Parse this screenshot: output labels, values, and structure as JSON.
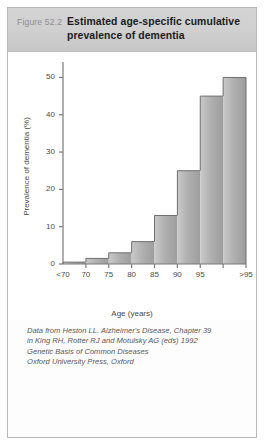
{
  "figure": {
    "number_label": "Figure 52.2",
    "title_line1": "Estimated age-specific cumulative",
    "title_line2": "prevalence of dementia"
  },
  "caption": {
    "line1": "Data from Heston LL. Alzheimer's Disease, Chapter 39",
    "line2": "in King RH, Rotter RJ and Motulsky AG (eds) 1992",
    "line3": "Genetic Basis of Common Diseases",
    "line4": "Oxford University Press, Oxford"
  },
  "colors": {
    "header_band": "#cfcfcf",
    "bar_fill": "#a8a8a8",
    "bar_edge": "#6f6f6f",
    "axis": "#7a7a7a",
    "text": "#4b4b4b"
  },
  "chart_data": {
    "type": "bar",
    "title": "Estimated age-specific cumulative prevalence of dementia",
    "xlabel": "Age (years)",
    "ylabel": "Prevalence of dementia (%)",
    "categories": [
      "<70",
      "70",
      "75",
      "80",
      "85",
      "90",
      "95",
      ">95"
    ],
    "values": [
      0.5,
      1.5,
      3,
      6,
      13,
      25,
      45,
      50
    ],
    "ylim": [
      0,
      52
    ],
    "yticks": [
      0,
      10,
      20,
      30,
      40,
      50
    ],
    "ytick_labels": [
      "0",
      "10",
      "20",
      "30",
      "40",
      "50"
    ],
    "xtick_labels": [
      "<70",
      "70",
      "75",
      "80",
      "85",
      "90",
      "95",
      ">95"
    ],
    "grid": false,
    "legend": "none",
    "style": "step-histogram, contiguous gray bars"
  }
}
